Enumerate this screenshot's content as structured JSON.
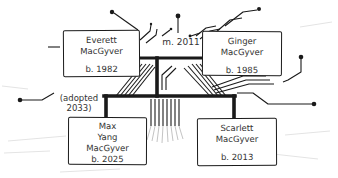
{
  "diagram": {
    "type": "family-tree-on-circuit-board",
    "marriage_label": "m. 2011",
    "adopted_label": {
      "line1": "(adopted",
      "line2": "2033)"
    },
    "people": {
      "everett": {
        "name_line1": "Everett",
        "name_line2": "MacGyver",
        "birth": "b. 1982"
      },
      "ginger": {
        "name_line1": "Ginger",
        "name_line2": "MacGyver",
        "birth": "b. 1985"
      },
      "max": {
        "name_line1": "Max",
        "name_line2": "Yang",
        "name_line3": "MacGyver",
        "birth": "b. 2025"
      },
      "scarlett": {
        "name_line1": "Scarlett",
        "name_line2": "MacGyver",
        "birth": "b. 2013"
      }
    },
    "colors": {
      "ink": "#1a1a1a",
      "text": "#333333",
      "faint_texture": "#e4e4e4",
      "pin_fade": "#c4c4c4",
      "box_bg": "#ffffff"
    }
  }
}
